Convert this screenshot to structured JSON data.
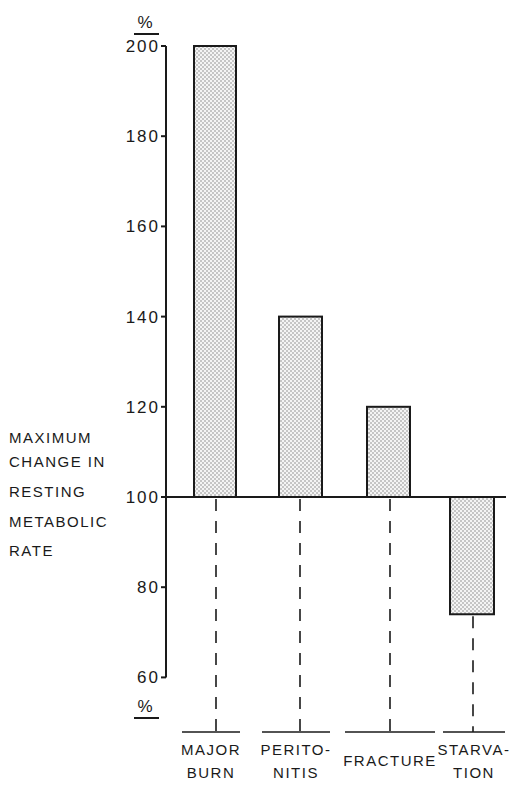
{
  "chart_data": {
    "type": "bar",
    "title": "",
    "ylabel": "MAXIMUM CHANGE IN RESTING METABOLIC RATE",
    "ylabel_lines": [
      "MAXIMUM",
      "CHANGE IN",
      "RESTING",
      "METABOLIC",
      "RATE"
    ],
    "xlabel": "",
    "unit_top": "%",
    "unit_bottom": "%",
    "ylim": [
      60,
      200
    ],
    "baseline": 100,
    "yticks": [
      200,
      180,
      160,
      140,
      120,
      100,
      80,
      60
    ],
    "categories": [
      "MAJOR BURN",
      "PERITONITIS",
      "FRACTURE",
      "STARVATION"
    ],
    "category_lines": [
      [
        "MAJOR",
        "BURN"
      ],
      [
        "PERITO-",
        "NITIS"
      ],
      [
        "FRACTURE"
      ],
      [
        "STARVA-",
        "TION"
      ]
    ],
    "values": [
      200,
      140,
      120,
      74
    ],
    "grid": false,
    "legend": null,
    "bar_fill": "dotted stipple"
  }
}
